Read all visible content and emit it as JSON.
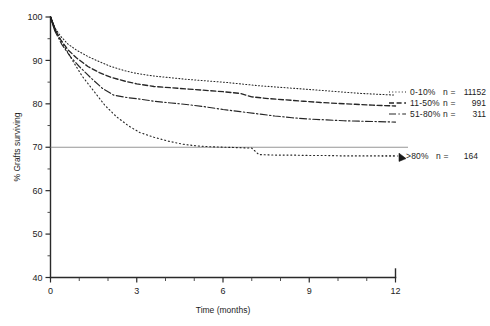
{
  "chart_data": {
    "type": "line",
    "title": "",
    "xlabel": "Time (months)",
    "ylabel": "% Grafts surviving",
    "xlim": [
      0,
      12
    ],
    "ylim": [
      40,
      100
    ],
    "x_ticks": [
      0,
      3,
      6,
      9,
      12
    ],
    "x_tick_labels": [
      "0",
      "3",
      "6",
      "9",
      "12"
    ],
    "x_minor_ticks": [
      1,
      2,
      4,
      5,
      7,
      8,
      10,
      11
    ],
    "y_ticks": [
      40,
      50,
      60,
      70,
      80,
      90,
      100
    ],
    "y_tick_labels": [
      "40",
      "50",
      "60",
      "70",
      "80",
      "90",
      "100"
    ],
    "y_minor_ticks": [
      45,
      55,
      65,
      75,
      85,
      95
    ],
    "grid": false,
    "reference_lines": [
      {
        "name": "70-percent-reference",
        "axis": "y",
        "value": 70
      }
    ],
    "legend_position": "right-inside",
    "series": [
      {
        "name": "0-10%",
        "label": "0-10%",
        "n_label": "n =",
        "n_value": "11152",
        "style": "dotted",
        "x": [
          0,
          0.15,
          0.35,
          0.6,
          0.9,
          1.3,
          1.7,
          2.1,
          2.6,
          3.0,
          3.6,
          4.2,
          4.8,
          5.4,
          6.0,
          6.6,
          7.2,
          7.8,
          8.4,
          9.0,
          9.6,
          10.2,
          10.8,
          11.4,
          12.0
        ],
        "values": [
          100,
          97.5,
          95.6,
          93.8,
          92.4,
          90.9,
          89.7,
          88.6,
          87.6,
          87.0,
          86.4,
          86.0,
          85.6,
          85.3,
          85.0,
          84.6,
          84.2,
          83.9,
          83.6,
          83.3,
          83.0,
          82.7,
          82.4,
          82.2,
          82.0
        ]
      },
      {
        "name": "11-50%",
        "label": "11-50%",
        "n_label": "n =",
        "n_value": "991",
        "style": "dashed",
        "x": [
          0,
          0.15,
          0.35,
          0.6,
          0.9,
          1.3,
          1.7,
          2.1,
          2.6,
          3.0,
          3.6,
          4.2,
          4.8,
          5.4,
          6.0,
          6.6,
          7.0,
          7.6,
          8.2,
          8.8,
          9.4,
          10.0,
          10.6,
          11.2,
          12.0
        ],
        "values": [
          100,
          97.2,
          94.8,
          92.5,
          90.6,
          88.6,
          87.2,
          86.1,
          85.2,
          84.6,
          84.0,
          83.7,
          83.4,
          83.1,
          82.8,
          82.4,
          81.6,
          81.2,
          80.9,
          80.6,
          80.3,
          80.1,
          79.9,
          79.7,
          79.5
        ]
      },
      {
        "name": "51-80%",
        "label": "51-80%",
        "n_label": "n =",
        "n_value": "311",
        "style": "dash-dot",
        "x": [
          0,
          0.15,
          0.4,
          0.7,
          1.0,
          1.4,
          1.8,
          2.2,
          2.7,
          3.1,
          3.6,
          4.2,
          4.8,
          5.4,
          6.0,
          6.6,
          7.2,
          7.8,
          8.4,
          9.0,
          9.6,
          10.2,
          10.8,
          11.4,
          12.0
        ],
        "values": [
          100,
          96.8,
          93.6,
          90.8,
          88.6,
          86.0,
          83.6,
          82.0,
          81.4,
          81.1,
          80.6,
          80.2,
          79.8,
          79.3,
          78.7,
          78.2,
          77.7,
          77.2,
          76.8,
          76.5,
          76.3,
          76.1,
          76.0,
          75.9,
          75.8
        ]
      },
      {
        "name": ">80%",
        "label": ">80%",
        "n_label": "n =",
        "n_value": "164",
        "style": "fine-dotted",
        "x": [
          0,
          0.2,
          0.5,
          0.8,
          1.1,
          1.5,
          1.9,
          2.3,
          2.7,
          3.1,
          3.6,
          4.1,
          4.6,
          5.1,
          5.6,
          6.1,
          6.6,
          7.0,
          7.25,
          7.8,
          8.4,
          9.0,
          9.6,
          10.2,
          10.8,
          11.4,
          12.0
        ],
        "values": [
          100,
          96.5,
          93.0,
          89.6,
          86.4,
          83.0,
          79.6,
          77.0,
          75.0,
          73.4,
          72.3,
          71.4,
          70.7,
          70.3,
          70.1,
          70.0,
          69.9,
          69.8,
          68.3,
          68.2,
          68.2,
          68.1,
          68.1,
          68.0,
          68.0,
          68.0,
          68.0
        ]
      }
    ]
  },
  "legend": {
    "entries": [
      {
        "label": "0-10%",
        "n_label": "n =",
        "n_value": "11152"
      },
      {
        "label": "11-50%",
        "n_label": "n =",
        "n_value": "991"
      },
      {
        "label": "51-80%",
        "n_label": "n =",
        "n_value": "311"
      },
      {
        "label": ">80%",
        "n_label": "n =",
        "n_value": "164"
      }
    ]
  }
}
